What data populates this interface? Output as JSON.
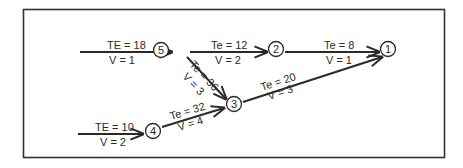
{
  "diagram": {
    "type": "pert-network",
    "nodes": [
      {
        "id": "5",
        "label": "5",
        "x": 181,
        "y": 49
      },
      {
        "id": "2",
        "label": "2",
        "x": 276,
        "y": 49
      },
      {
        "id": "1",
        "label": "1",
        "x": 388,
        "y": 49
      },
      {
        "id": "3",
        "label": "3",
        "x": 233,
        "y": 105
      },
      {
        "id": "4",
        "label": "4",
        "x": 152,
        "y": 131
      }
    ],
    "edges": [
      {
        "from": "start-a",
        "to": "5",
        "te_label": "TE = 18",
        "v_label": "V = 1"
      },
      {
        "from": "5",
        "to": "2",
        "te_label": "Te = 12",
        "v_label": "V = 2"
      },
      {
        "from": "2",
        "to": "1",
        "te_label": "Te = 8",
        "v_label": "V = 1"
      },
      {
        "from": "5",
        "to": "3",
        "te_label": "Te = 36",
        "v_label": "V = 3"
      },
      {
        "from": "3",
        "to": "1",
        "te_label": "Te = 20",
        "v_label": "V = 3"
      },
      {
        "from": "4",
        "to": "3",
        "te_label": "Te = 32",
        "v_label": "V = 4"
      },
      {
        "from": "start-b",
        "to": "4",
        "te_label": "TE = 10",
        "v_label": "V = 2"
      }
    ]
  }
}
